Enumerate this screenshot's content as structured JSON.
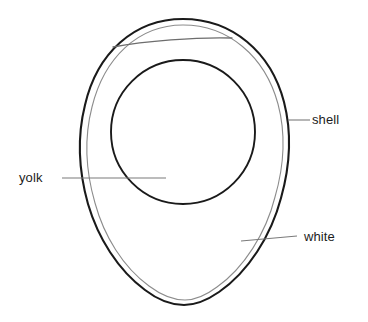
{
  "diagram": {
    "background_color": "#ffffff",
    "outline_color": "#1a1a1a",
    "membrane_color": "#8c8c8c",
    "leader_color": "#7a7a7a",
    "text_color": "#1c1c1c"
  },
  "labels": {
    "shell": "shell",
    "yolk": "yolk",
    "white": "white"
  },
  "parts": [
    {
      "name": "shell",
      "label": "shell",
      "label_position": {
        "x": 312,
        "y": 112
      },
      "leader": {
        "x1": 288,
        "y1": 120,
        "x2": 310,
        "y2": 120
      }
    },
    {
      "name": "yolk",
      "label": "yolk",
      "label_position": {
        "x": 19,
        "y": 170
      },
      "leader": {
        "x1": 62,
        "y1": 178,
        "x2": 166,
        "y2": 178
      }
    },
    {
      "name": "white",
      "label": "white",
      "label_position": {
        "x": 304,
        "y": 229
      },
      "leader": {
        "x1": 241,
        "y1": 241,
        "x2": 297,
        "y2": 236
      }
    }
  ],
  "geometry": {
    "egg_outline": {
      "top_apex": {
        "x": 183,
        "y": 19
      },
      "bottom_apex": {
        "x": 184,
        "y": 305
      },
      "left_extreme": {
        "x": 80,
        "y": 150
      },
      "right_extreme": {
        "x": 288,
        "y": 143
      }
    },
    "yolk_circle": {
      "center": {
        "x": 183,
        "y": 132
      },
      "radius": 72
    },
    "air_cell_line": {
      "start": {
        "x": 113,
        "y": 47
      },
      "end": {
        "x": 232,
        "y": 38
      }
    }
  }
}
